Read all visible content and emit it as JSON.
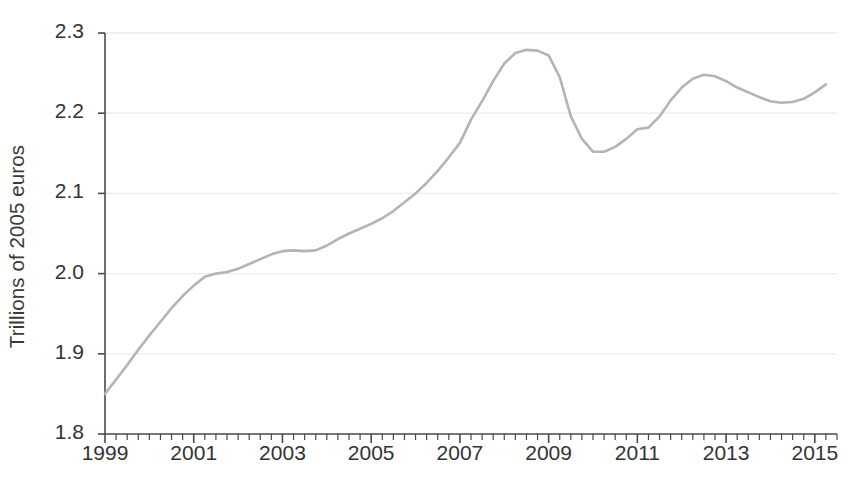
{
  "chart_data": {
    "type": "line",
    "title": "",
    "subtitle": "",
    "xlabel": "",
    "ylabel": "Trillions of 2005 euros",
    "ylim": [
      1.8,
      2.3
    ],
    "xlim": [
      1999.0,
      2015.5
    ],
    "ytick_labels": [
      "2.3",
      "2.2",
      "2.1",
      "2.0",
      "1.9",
      "1.8"
    ],
    "ytick_values": [
      2.3,
      2.2,
      2.1,
      2.0,
      1.9,
      1.8
    ],
    "xtick_labels": [
      "1999",
      "2001",
      "2003",
      "2005",
      "2007",
      "2009",
      "2011",
      "2013",
      "2015"
    ],
    "xtick_values": [
      1999,
      2001,
      2003,
      2005,
      2007,
      2009,
      2011,
      2013,
      2015
    ],
    "x_minor_tick_interval_years": 0.25,
    "grid": "horizontal",
    "legend": "none",
    "line_color": "#b4b4b4",
    "line_width_px": 2.6,
    "axis_color": "#4a4a4a",
    "grid_color": "#ebebeb",
    "series": [
      {
        "name": "Real GDP",
        "x": [
          1999.0,
          1999.25,
          1999.5,
          1999.75,
          2000.0,
          2000.25,
          2000.5,
          2000.75,
          2001.0,
          2001.25,
          2001.5,
          2001.75,
          2002.0,
          2002.25,
          2002.5,
          2002.75,
          2003.0,
          2003.25,
          2003.5,
          2003.75,
          2004.0,
          2004.25,
          2004.5,
          2004.75,
          2005.0,
          2005.25,
          2005.5,
          2005.75,
          2006.0,
          2006.25,
          2006.5,
          2006.75,
          2007.0,
          2007.25,
          2007.5,
          2007.75,
          2008.0,
          2008.25,
          2008.5,
          2008.75,
          2009.0,
          2009.25,
          2009.5,
          2009.75,
          2010.0,
          2010.25,
          2010.5,
          2010.75,
          2011.0,
          2011.25,
          2011.5,
          2011.75,
          2012.0,
          2012.25,
          2012.5,
          2012.75,
          2013.0,
          2013.25,
          2013.5,
          2013.75,
          2014.0,
          2014.25,
          2014.5,
          2014.75,
          2015.0,
          2015.25
        ],
        "values": [
          1.85,
          1.868,
          1.886,
          1.905,
          1.923,
          1.94,
          1.957,
          1.972,
          1.985,
          1.996,
          2.0,
          2.002,
          2.006,
          2.012,
          2.018,
          2.024,
          2.028,
          2.029,
          2.028,
          2.029,
          2.035,
          2.043,
          2.05,
          2.056,
          2.062,
          2.069,
          2.078,
          2.089,
          2.1,
          2.113,
          2.128,
          2.145,
          2.163,
          2.192,
          2.215,
          2.24,
          2.262,
          2.275,
          2.279,
          2.278,
          2.272,
          2.245,
          2.196,
          2.168,
          2.152,
          2.152,
          2.158,
          2.168,
          2.18,
          2.182,
          2.196,
          2.216,
          2.232,
          2.243,
          2.248,
          2.246,
          2.24,
          2.232,
          2.226,
          2.22,
          2.215,
          2.213,
          2.214,
          2.218,
          2.226,
          2.236
        ]
      }
    ],
    "annotations": {
      "start_value": 1.85,
      "start_year": 1999,
      "pre_crisis_peak_value": 2.279,
      "pre_crisis_peak_year": 2008.5,
      "trough_value": 2.152,
      "trough_year": 2009.75,
      "recovery_peak_value": 2.248,
      "recovery_peak_year": 2012.5,
      "second_dip_value": 2.213,
      "second_dip_year": 2014.25,
      "end_value": 2.27,
      "end_year": 2015.5
    }
  },
  "axis": {
    "y_title": "Trillions of 2005 euros"
  }
}
